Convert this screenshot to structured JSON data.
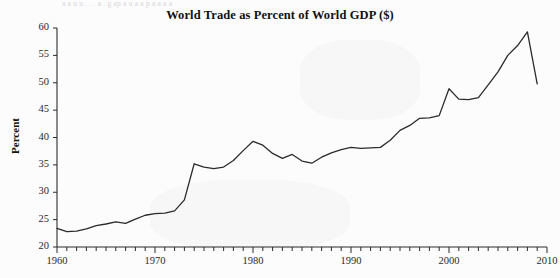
{
  "page": {
    "background_color": "#fcfcfc",
    "bleed_text": "a  a  u   u   .  .    .       a         . g     ap    a  u   a  a p a   a a a",
    "ink_color": "#2b2b2b"
  },
  "chart_data": {
    "type": "line",
    "title": "World Trade as Percent of World GDP ($)",
    "xlabel": "",
    "ylabel": "Percent",
    "xlim": [
      1960,
      2010
    ],
    "ylim": [
      20,
      60
    ],
    "ytick_values": [
      20,
      25,
      30,
      35,
      40,
      45,
      50,
      55,
      60
    ],
    "ytick_labels": [
      "20",
      "25",
      "30",
      "35",
      "40",
      "45",
      "50",
      "55",
      "60"
    ],
    "xtick_values": [
      1960,
      1970,
      1980,
      1990,
      2000,
      2010
    ],
    "xtick_labels": [
      "1960",
      "1970",
      "1980",
      "1990",
      "2000",
      "2010"
    ],
    "xminor_step": 1,
    "grid": false,
    "legend": false,
    "line_color": "#2b2b2b",
    "line_width": 1.3,
    "series": [
      {
        "name": "World Trade as Percent of World GDP ($)",
        "x": [
          1960,
          1961,
          1962,
          1963,
          1964,
          1965,
          1966,
          1967,
          1968,
          1969,
          1970,
          1971,
          1972,
          1973,
          1974,
          1975,
          1976,
          1977,
          1978,
          1979,
          1980,
          1981,
          1982,
          1983,
          1984,
          1985,
          1986,
          1987,
          1988,
          1989,
          1990,
          1991,
          1992,
          1993,
          1994,
          1995,
          1996,
          1997,
          1998,
          1999,
          2000,
          2001,
          2002,
          2003,
          2004,
          2005,
          2006,
          2007,
          2008,
          2009
        ],
        "values": [
          23.4,
          22.8,
          22.9,
          23.3,
          23.9,
          24.2,
          24.6,
          24.3,
          25.1,
          25.8,
          26.1,
          26.2,
          26.6,
          28.6,
          35.2,
          34.6,
          34.3,
          34.6,
          35.8,
          37.6,
          39.3,
          38.6,
          37.1,
          36.2,
          36.9,
          35.7,
          35.3,
          36.4,
          37.2,
          37.8,
          38.2,
          38.0,
          38.1,
          38.2,
          39.5,
          41.3,
          42.2,
          43.5,
          43.6,
          44.0,
          48.9,
          47.0,
          46.9,
          47.3,
          49.6,
          52.0,
          55.0,
          56.8,
          59.3,
          49.8
        ]
      }
    ],
    "annotations": [
      {
        "label": "1974 oil-shock jump",
        "x": 1974,
        "y": 35.2
      },
      {
        "label": "1980 peak",
        "x": 1980,
        "y": 39.3
      },
      {
        "label": "mid-1980s trough",
        "x": 1986,
        "y": 35.3
      },
      {
        "label": "2000 peak",
        "x": 2000,
        "y": 48.9
      },
      {
        "label": "2008 peak",
        "x": 2008,
        "y": 59.3
      },
      {
        "label": "2009 crisis drop",
        "x": 2009,
        "y": 49.8
      }
    ]
  }
}
